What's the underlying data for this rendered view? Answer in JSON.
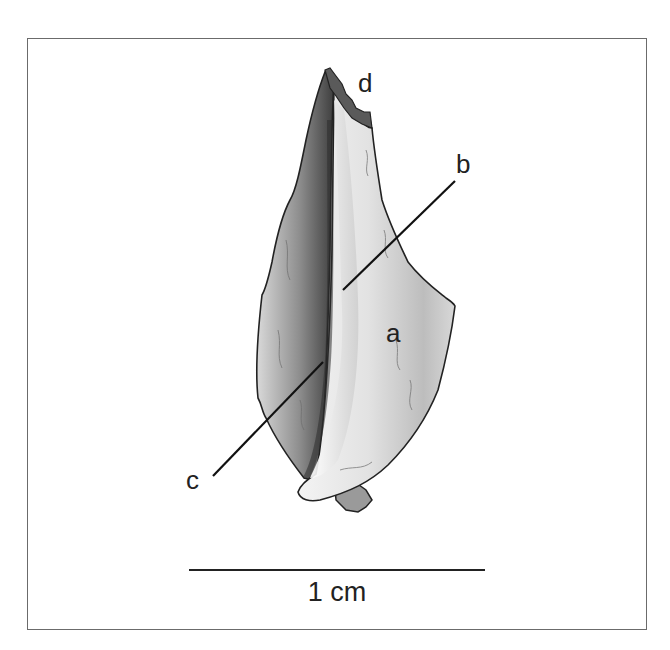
{
  "figure": {
    "type": "anatomical specimen illustration",
    "frame_color": "#6b6b6b",
    "labels": [
      {
        "id": "a",
        "text": "a",
        "x": 386,
        "y": 320
      },
      {
        "id": "b",
        "text": "b",
        "x": 456,
        "y": 151
      },
      {
        "id": "c",
        "text": "c",
        "x": 186,
        "y": 467
      },
      {
        "id": "d",
        "text": "d",
        "x": 358,
        "y": 70
      }
    ],
    "leader_lines": [
      {
        "label": "b",
        "x1": 455,
        "y1": 181,
        "x2": 343,
        "y2": 290
      },
      {
        "label": "c",
        "x1": 213,
        "y1": 476,
        "x2": 323,
        "y2": 362
      }
    ],
    "scale": {
      "label": "1 cm",
      "length_px": 296
    }
  }
}
